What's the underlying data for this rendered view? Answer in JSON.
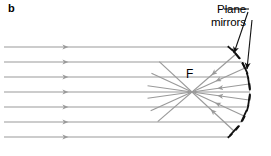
{
  "figure": {
    "panel_label": "b",
    "focal_label": "F",
    "annotation": {
      "line1": "Plane",
      "line2": "mirrors"
    },
    "colors": {
      "ray": "#9a9a9a",
      "mirror": "#111111",
      "text": "#000000",
      "arc": "#111111",
      "background": "#ffffff"
    },
    "geometry": {
      "focus": {
        "x": 192,
        "y": 92
      },
      "incoming_ray_y": [
        47,
        62,
        77,
        92,
        107,
        122,
        137
      ],
      "incoming_ray_x_start": 4,
      "incoming_arrow_x": 68,
      "arc_center_x": 192,
      "arc_center_y": 92,
      "arc_radius": 58,
      "mirror_points": [
        {
          "x": 236,
          "y": 54
        },
        {
          "x": 245,
          "y": 68
        },
        {
          "x": 249,
          "y": 84
        },
        {
          "x": 249,
          "y": 100
        },
        {
          "x": 244,
          "y": 116
        },
        {
          "x": 234,
          "y": 131
        }
      ],
      "leader_lines": [
        {
          "x1": 248,
          "y1": 12,
          "x2": 234,
          "y2": 53
        },
        {
          "x1": 252,
          "y1": 20,
          "x2": 247,
          "y2": 69
        }
      ]
    }
  }
}
